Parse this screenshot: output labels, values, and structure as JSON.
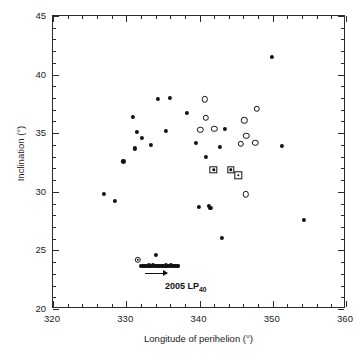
{
  "chart_data": {
    "type": "scatter",
    "title": "",
    "xlabel": "Longitude of perihelion (°)",
    "ylabel": "Inclination (°)",
    "xlim": [
      320,
      360
    ],
    "ylim": [
      20,
      45
    ],
    "xticks": [
      320,
      330,
      340,
      350,
      360
    ],
    "yticks": [
      20,
      25,
      30,
      35,
      40,
      45
    ],
    "x_minor_step": 2,
    "y_minor_step": 1,
    "grid": false,
    "legend": null,
    "series": [
      {
        "name": "filled-circle",
        "marker": "filled circle",
        "color": "#111111",
        "points": [
          [
            327.0,
            29.8
          ],
          [
            328.4,
            29.2
          ],
          [
            329.6,
            32.6
          ],
          [
            330.9,
            36.4
          ],
          [
            331.2,
            33.7
          ],
          [
            331.5,
            35.1
          ],
          [
            332.1,
            34.6
          ],
          [
            333.4,
            34.0
          ],
          [
            334.3,
            37.9
          ],
          [
            335.4,
            35.2
          ],
          [
            336.0,
            38.0
          ],
          [
            338.3,
            36.7
          ],
          [
            339.5,
            34.2
          ],
          [
            340.9,
            33.0
          ],
          [
            339.9,
            28.7
          ],
          [
            341.3,
            28.8
          ],
          [
            341.5,
            28.6
          ],
          [
            342.8,
            33.8
          ],
          [
            343.5,
            35.4
          ],
          [
            343.1,
            26.1
          ],
          [
            349.9,
            41.5
          ],
          [
            351.2,
            33.9
          ],
          [
            354.2,
            27.6
          ],
          [
            334.1,
            24.6
          ]
        ]
      },
      {
        "name": "open-circle",
        "marker": "open circle",
        "color": "#111111",
        "points": [
          [
            340.7,
            37.9
          ],
          [
            340.9,
            36.3
          ],
          [
            340.1,
            35.3
          ],
          [
            342.0,
            35.4
          ],
          [
            346.1,
            36.1
          ],
          [
            347.8,
            37.1
          ],
          [
            346.4,
            34.8
          ],
          [
            345.6,
            34.1
          ],
          [
            347.6,
            34.2
          ],
          [
            346.3,
            29.8
          ]
        ]
      },
      {
        "name": "square-with-dot",
        "marker": "open square with central dot",
        "color": "#111111",
        "points": [
          [
            341.9,
            31.9
          ],
          [
            344.3,
            31.9
          ],
          [
            345.3,
            31.4
          ]
        ]
      },
      {
        "name": "circled-dot",
        "marker": "small open circle with central dot",
        "color": "#111111",
        "points": [
          [
            331.6,
            24.2
          ]
        ]
      },
      {
        "name": "dense-row-2005LP40",
        "marker": "filled circle",
        "color": "#111111",
        "note": "dense overlapping horizontal row of clones",
        "points": [
          [
            332.3,
            23.7
          ],
          [
            332.6,
            23.7
          ],
          [
            332.9,
            23.7
          ],
          [
            333.2,
            23.7
          ],
          [
            333.5,
            23.7
          ],
          [
            333.8,
            23.7
          ],
          [
            334.1,
            23.7
          ],
          [
            334.4,
            23.7
          ],
          [
            334.7,
            23.7
          ],
          [
            335.0,
            23.7
          ],
          [
            335.3,
            23.7
          ],
          [
            335.6,
            23.7
          ],
          [
            335.9,
            23.7
          ],
          [
            336.2,
            23.7
          ],
          [
            336.5,
            23.7
          ],
          [
            336.8,
            23.7
          ],
          [
            337.1,
            23.7
          ],
          [
            332.0,
            23.7
          ],
          [
            333.05,
            23.72
          ],
          [
            334.25,
            23.68
          ],
          [
            335.45,
            23.72
          ],
          [
            336.65,
            23.68
          ],
          [
            332.45,
            23.65
          ],
          [
            333.65,
            23.75
          ],
          [
            334.85,
            23.65
          ],
          [
            336.05,
            23.75
          ],
          [
            337.0,
            23.7
          ]
        ]
      }
    ],
    "annotations": [
      {
        "name": "2005-lp40-label",
        "text_main": "2005 LP",
        "text_sub": "40",
        "x": 335.3,
        "y": 22.35,
        "arrow": {
          "x_start": 332.6,
          "x_end": 335.6,
          "y": 23.1
        }
      }
    ]
  }
}
